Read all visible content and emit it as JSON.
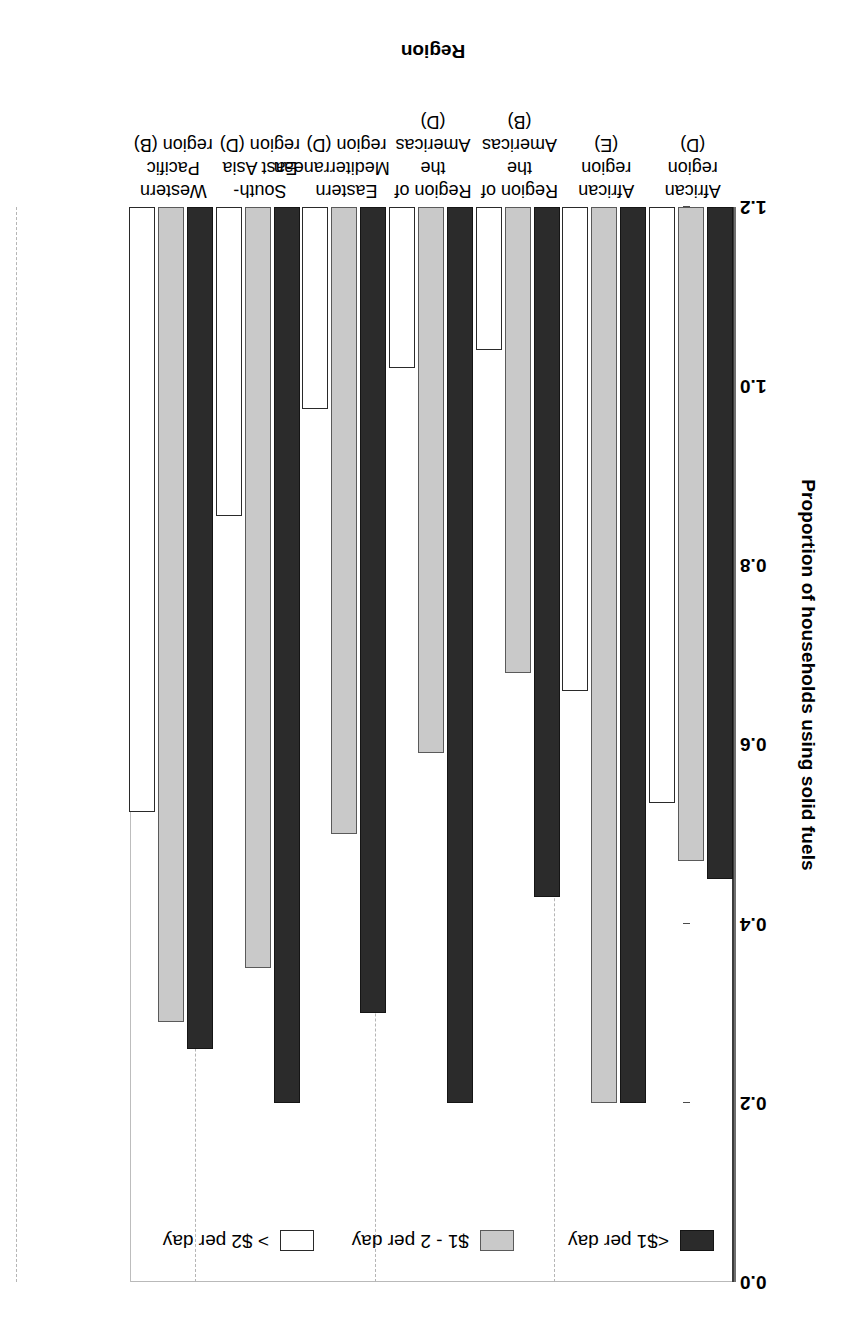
{
  "chart_data": {
    "type": "bar",
    "title": "",
    "xlabel": "Region",
    "ylabel": "Proportion of households using solid fuels",
    "ylim": [
      0.0,
      1.2
    ],
    "yticks": [
      "0.0",
      "0.2",
      "0.4",
      "0.6",
      "0.8",
      "1.0",
      "1.2"
    ],
    "ytick_values": [
      0.0,
      0.2,
      0.4,
      0.6,
      0.8,
      1.0,
      1.2
    ],
    "grid": "y-gridlines-dashed",
    "legend_position": "top-left-inside",
    "orientation": "vertical-bars-grouped",
    "categories": [
      "African region\n(D)",
      "African region\n(E)",
      "Region of the\nAmericas (B)",
      "Region of the\nAmericas (D)",
      "Eastern\nMediterranean\nregion (D)",
      "South-East Asia\nregion (D)",
      "Western Pacific\nregion (B)"
    ],
    "category_lines": [
      [
        "African region",
        "(D)"
      ],
      [
        "African region",
        "(E)"
      ],
      [
        "Region of the",
        "Americas (B)"
      ],
      [
        "Region of the",
        "Americas (D)"
      ],
      [
        "Eastern",
        "Mediterranean",
        "region (D)"
      ],
      [
        "South-East Asia",
        "region (D)"
      ],
      [
        "Western Pacific",
        "region (B)"
      ]
    ],
    "series": [
      {
        "name": "<$1 per day",
        "color": "#2b2b2b",
        "values": [
          0.75,
          1.0,
          0.77,
          1.0,
          0.9,
          1.0,
          0.94
        ]
      },
      {
        "name": "$1 - 2 per day",
        "color": "#c9c9c9",
        "values": [
          0.73,
          1.0,
          0.52,
          0.61,
          0.7,
          0.85,
          0.91
        ]
      },
      {
        "name": "> $2 per day",
        "color": "#ffffff",
        "values": [
          0.665,
          0.54,
          0.16,
          0.18,
          0.225,
          0.345,
          0.675
        ]
      }
    ]
  },
  "legend": {
    "items": [
      {
        "label": "<$1 per day",
        "swatch": "black-filled-swatch"
      },
      {
        "label": "$1 - 2 per day",
        "swatch": "gray-filled-swatch"
      },
      {
        "label": "> $2 per day",
        "swatch": "white-empty-swatch"
      }
    ]
  },
  "axes": {
    "y_title": "Proportion of households using solid fuels",
    "x_title": "Region",
    "y_ticks": [
      "1.2",
      "1.0",
      "0.8",
      "0.6",
      "0.4",
      "0.2",
      "0.0"
    ]
  },
  "colors": {
    "series_1": "#2b2b2b",
    "series_2": "#c9c9c9",
    "series_3": "#ffffff",
    "axis": "#3c3c3c",
    "grid": "#b5b5b5",
    "background": "#ffffff"
  }
}
